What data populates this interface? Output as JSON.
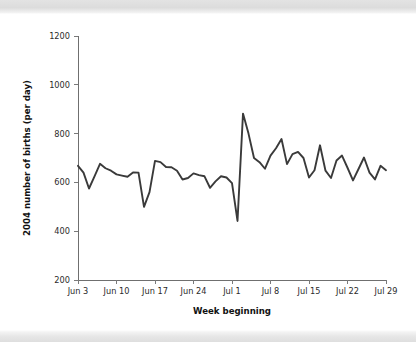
{
  "figure": {
    "background_color": "#ffffff",
    "band_color": "#dedede",
    "line_color": "#3a3a3a",
    "axis_color": "#6f6f6f",
    "text_color": "#2b2b2b"
  },
  "chart_data": {
    "type": "line",
    "title": "",
    "subtitle": "",
    "xlabel": "Week beginning",
    "ylabel": "2004 number of births (per day)",
    "ylim": [
      200,
      1200
    ],
    "ytick_labels": [
      "200",
      "400",
      "600",
      "800",
      "1000",
      "1200"
    ],
    "ytick_values": [
      200,
      400,
      600,
      800,
      1000,
      1200
    ],
    "xtick_labels": [
      "Jun 3",
      "Jun 10",
      "Jun 17",
      "Jun 24",
      "Jul 1",
      "Jul 8",
      "Jul 15",
      "Jul 22",
      "Jul 29"
    ],
    "xtick_values": [
      0,
      7,
      14,
      21,
      28,
      35,
      42,
      49,
      56
    ],
    "xlim": [
      0,
      56
    ],
    "grid": false,
    "legend": false,
    "legend_position": "none",
    "series": [
      {
        "name": "2004 births per day",
        "x": [
          0,
          1,
          2,
          3,
          4,
          5,
          6,
          7,
          8,
          9,
          10,
          11,
          12,
          13,
          14,
          15,
          16,
          17,
          18,
          19,
          20,
          21,
          22,
          23,
          24,
          25,
          26,
          27,
          28,
          29,
          30,
          31,
          32,
          33,
          34,
          35,
          36,
          37,
          38,
          39,
          40,
          41,
          42,
          43,
          44,
          45,
          46,
          47,
          48,
          49,
          50,
          51,
          52,
          53,
          54,
          55,
          56
        ],
        "values": [
          668,
          640,
          575,
          625,
          676,
          658,
          648,
          633,
          628,
          623,
          641,
          640,
          500,
          560,
          688,
          683,
          663,
          662,
          648,
          612,
          618,
          637,
          630,
          625,
          578,
          604,
          625,
          620,
          597,
          442,
          882,
          800,
          700,
          683,
          656,
          710,
          740,
          778,
          675,
          716,
          725,
          700,
          620,
          650,
          752,
          648,
          618,
          690,
          710,
          660,
          608,
          655,
          702,
          640,
          612,
          668,
          650
        ]
      }
    ],
    "annotations": []
  }
}
